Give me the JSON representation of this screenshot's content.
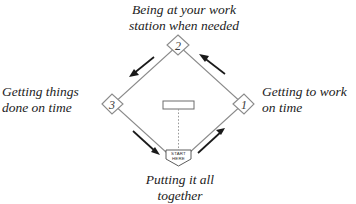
{
  "diagram": {
    "title_labels": {
      "top": "Being at your work\nstation when needed",
      "right": "Getting to work\non time",
      "left": "Getting things\ndone on time",
      "bottom": "Putting it all\ntogether"
    },
    "bases": [
      {
        "id": "base-1",
        "number": "1",
        "position": "right"
      },
      {
        "id": "base-2",
        "number": "2",
        "position": "top"
      },
      {
        "id": "base-3",
        "number": "3",
        "position": "left"
      }
    ],
    "home_plate": {
      "line1": "START",
      "line2": "HERE"
    },
    "arrows": [
      {
        "id": "arrow-home-to-first",
        "direction": "up-right",
        "edge": "bottom-right"
      },
      {
        "id": "arrow-first-to-second",
        "direction": "up-left",
        "edge": "top-right"
      },
      {
        "id": "arrow-second-to-third",
        "direction": "down-left",
        "edge": "top-left"
      },
      {
        "id": "arrow-third-to-home",
        "direction": "down-right",
        "edge": "bottom-left"
      }
    ],
    "colors": {
      "line": "#8a8a8a",
      "arrow": "#1a1a1a",
      "text": "#222222",
      "background": "#ffffff"
    }
  }
}
